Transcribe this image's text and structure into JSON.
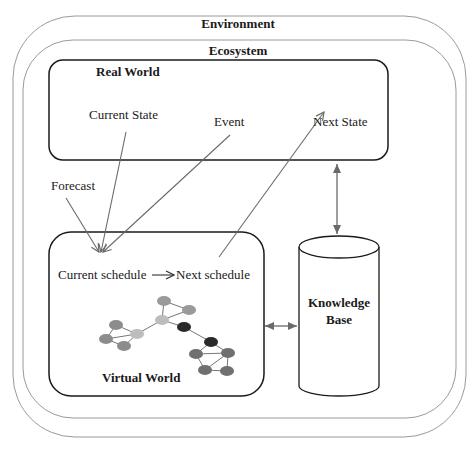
{
  "environment": {
    "label": "Environment"
  },
  "ecosystem": {
    "label": "Ecosystem"
  },
  "real_world": {
    "title": "Real World",
    "current_state": "Current State",
    "event": "Event",
    "next_state": "Next State"
  },
  "forecast": {
    "label": "Forecast"
  },
  "virtual_world": {
    "title": "Virtual World",
    "current_schedule": "Current schedule",
    "next_schedule": "Next schedule"
  },
  "knowledge_base": {
    "line1": "Knowledge",
    "line2": "Base"
  },
  "colors": {
    "outer_border": "#9a9a9a",
    "box_border": "#1a1a1a",
    "arrow": "#6a6a6a",
    "node_light": "#bdbdbd",
    "node_mid": "#8c8c8c",
    "node_dark": "#2a2a2a"
  }
}
